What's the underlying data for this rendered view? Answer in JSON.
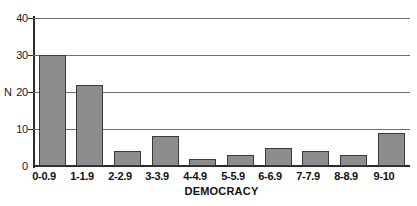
{
  "chart_data": {
    "type": "bar",
    "title": "",
    "xlabel": "DEMOCRACY",
    "ylabel": "N",
    "categories": [
      "0-0.9",
      "1-1.9",
      "2-2.9",
      "3-3.9",
      "4-4.9",
      "5-5.9",
      "6-6.9",
      "7-7.9",
      "8-8.9",
      "9-10"
    ],
    "values": [
      30,
      22,
      4,
      8,
      2,
      3,
      5,
      4,
      3,
      9
    ],
    "ylim": [
      0,
      40
    ],
    "yticks": [
      0,
      10,
      20,
      30,
      40
    ],
    "ytick_labels": [
      "0",
      "10",
      "20",
      "30",
      "40"
    ],
    "grid": true,
    "legend": false,
    "bar_color": "#8d8d8d",
    "bar_edge_color": "#3a3a3a",
    "axis_color": "#2b2b2b",
    "grid_color": "#6e6e6e",
    "background": "#ffffff"
  }
}
